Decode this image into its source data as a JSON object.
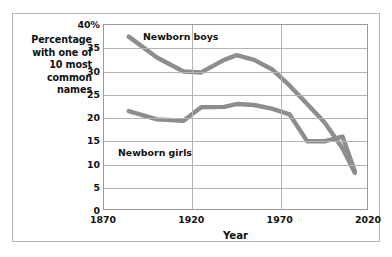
{
  "chart_data": {
    "type": "line",
    "title": "",
    "xlabel": "Year",
    "ylabel": "Percentage with one of 10 most common names",
    "xlim": [
      1870,
      2020
    ],
    "ylim": [
      0,
      40
    ],
    "grid": true,
    "legend_position": "inline-annotation",
    "x_ticks": [
      "1870",
      "1920",
      "1970",
      "2020"
    ],
    "x_tick_values": [
      1870,
      1920,
      1970,
      2020
    ],
    "y_ticks": [
      "0",
      "5",
      "10",
      "15",
      "20",
      "25",
      "30",
      "35",
      "40%"
    ],
    "y_tick_values": [
      0,
      5,
      10,
      15,
      20,
      25,
      30,
      35,
      40
    ],
    "series": [
      {
        "name": "Newborn boys",
        "color": "#8d8d8d",
        "x": [
          1884,
          1900,
          1915,
          1925,
          1938,
          1945,
          1955,
          1965,
          1975,
          1985,
          1995,
          2005,
          2012
        ],
        "values": [
          37.5,
          33.0,
          30.0,
          29.8,
          32.5,
          33.5,
          32.5,
          30.5,
          27.0,
          23.0,
          19.0,
          13.5,
          8.2
        ]
      },
      {
        "name": "Newborn girls",
        "color": "#8d8d8d",
        "x": [
          1884,
          1900,
          1915,
          1925,
          1938,
          1945,
          1955,
          1965,
          1975,
          1985,
          1995,
          2005,
          2012
        ],
        "values": [
          21.5,
          19.7,
          19.4,
          22.3,
          22.4,
          23.0,
          22.8,
          22.0,
          20.8,
          15.0,
          15.0,
          16.0,
          8.5
        ]
      }
    ],
    "annotations": [
      {
        "text": "Newborn boys",
        "for": "Newborn boys"
      },
      {
        "text": "Newborn girls",
        "for": "Newborn girls"
      }
    ]
  },
  "labels": {
    "y_axis_caption_lines": [
      "Percentage",
      "with one of",
      "10 most",
      "common",
      "names"
    ]
  }
}
